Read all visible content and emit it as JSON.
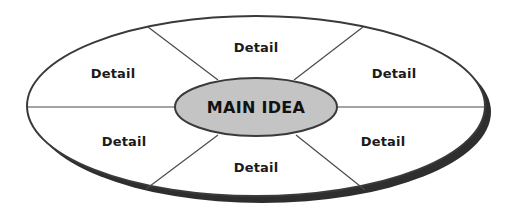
{
  "diagram": {
    "type": "main-idea-web",
    "center": {
      "label": "MAIN IDEA",
      "fill": "#c4c4c4"
    },
    "details": [
      {
        "position": "top",
        "label": "Detail"
      },
      {
        "position": "upper-left",
        "label": "Detail"
      },
      {
        "position": "upper-right",
        "label": "Detail"
      },
      {
        "position": "lower-left",
        "label": "Detail"
      },
      {
        "position": "lower-right",
        "label": "Detail"
      },
      {
        "position": "bottom",
        "label": "Detail"
      }
    ],
    "colors": {
      "outline": "#3a3a3a",
      "shadow": "#2e2e2e",
      "background": "#ffffff",
      "center_fill": "#c4c4c4"
    }
  }
}
